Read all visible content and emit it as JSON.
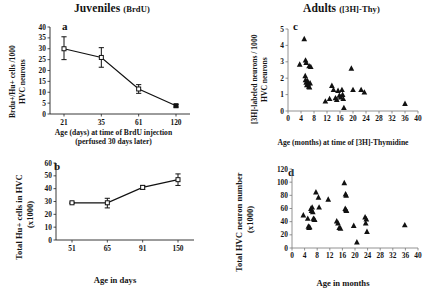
{
  "figure": {
    "group_titles": [
      {
        "main": "Juveniles",
        "sub": "(BrdU)"
      },
      {
        "main": "Adults",
        "sub": "([3H]-Thy)"
      }
    ]
  },
  "chart_data": [
    {
      "panel": "a",
      "type": "line",
      "title": "Juveniles (BrdU)",
      "xlabel": "Age (days) at time of BrdU injection",
      "xlabel_sub": "(perfused 30 days later)",
      "ylabel": "Brdu+/Hu+ cells /1000 HVC neurons",
      "categories": [
        "21",
        "35",
        "61",
        "120"
      ],
      "x": [
        21,
        35,
        61,
        120
      ],
      "values": [
        30.0,
        26.0,
        11.5,
        3.8
      ],
      "yerr_up": [
        5.5,
        4.5,
        2.0,
        0.6
      ],
      "yerr_down": [
        5.0,
        4.5,
        2.0,
        0.6
      ],
      "ylim": [
        0,
        40
      ],
      "yticks": [
        "0",
        "5",
        "10",
        "15",
        "20",
        "25",
        "30",
        "35",
        "40"
      ],
      "xticks": [
        "21",
        "35",
        "61",
        "120"
      ],
      "marker": "open-square",
      "grid": false,
      "legend": "none"
    },
    {
      "panel": "b",
      "type": "line",
      "title": "",
      "xlabel": "Age in days",
      "ylabel": "Total Hu+ cells in HVC (x1000)",
      "categories": [
        "51",
        "65",
        "91",
        "150"
      ],
      "x": [
        51,
        65,
        91,
        150
      ],
      "values": [
        29.0,
        29.0,
        41.0,
        47.0
      ],
      "yerr_up": [
        0.5,
        3.5,
        1.5,
        4.5
      ],
      "yerr_down": [
        0.5,
        4.0,
        1.5,
        4.5
      ],
      "ylim": [
        0,
        60
      ],
      "yticks": [
        "0",
        "10",
        "20",
        "30",
        "40",
        "50",
        "60"
      ],
      "xticks": [
        "51",
        "65",
        "91",
        "150"
      ],
      "marker": "open-square",
      "grid": false,
      "legend": "none"
    },
    {
      "panel": "c",
      "type": "scatter",
      "title": "Adults ([3H]-Thy)",
      "xlabel": "Age (months) at time of [3H]-Thymidine",
      "ylabel": "[3H]-labeled neurons / 1000 HVC neurons",
      "xlim": [
        0,
        40
      ],
      "ylim": [
        0,
        5
      ],
      "yticks": [
        "0",
        "1",
        "2",
        "3",
        "4",
        "5"
      ],
      "xticks": [
        "0",
        "4",
        "8",
        "12",
        "16",
        "20",
        "24",
        "28",
        "32",
        "36",
        "40"
      ],
      "marker": "filled-triangle",
      "grid": false,
      "legend": "none",
      "points": [
        [
          5.0,
          4.4
        ],
        [
          3.6,
          2.85
        ],
        [
          5.4,
          3.1
        ],
        [
          5.6,
          2.95
        ],
        [
          6.5,
          2.75
        ],
        [
          7.0,
          2.7
        ],
        [
          5.3,
          2.15
        ],
        [
          5.4,
          1.9
        ],
        [
          5.6,
          1.75
        ],
        [
          5.8,
          1.6
        ],
        [
          6.0,
          1.85
        ],
        [
          6.2,
          1.65
        ],
        [
          6.4,
          1.5
        ],
        [
          6.6,
          1.45
        ],
        [
          6.8,
          1.7
        ],
        [
          11.5,
          0.6
        ],
        [
          12.8,
          0.75
        ],
        [
          13.5,
          1.55
        ],
        [
          14.0,
          1.3
        ],
        [
          14.6,
          0.8
        ],
        [
          15.0,
          0.7
        ],
        [
          15.4,
          1.25
        ],
        [
          15.8,
          0.95
        ],
        [
          16.2,
          0.85
        ],
        [
          16.6,
          1.3
        ],
        [
          16.8,
          1.0
        ],
        [
          17.0,
          0.75
        ],
        [
          17.2,
          0.2
        ],
        [
          19.5,
          2.6
        ],
        [
          20.0,
          1.3
        ],
        [
          22.5,
          1.3
        ],
        [
          23.5,
          1.15
        ],
        [
          36.0,
          0.45
        ]
      ]
    },
    {
      "panel": "d",
      "type": "scatter",
      "title": "",
      "xlabel": "Age in months",
      "ylabel": "Total HVC neuron number (x1000)",
      "xlim": [
        0,
        40
      ],
      "ylim": [
        0,
        120
      ],
      "yticks": [
        "0",
        "20",
        "40",
        "60",
        "80",
        "100",
        "120"
      ],
      "xticks": [
        "0",
        "4",
        "8",
        "12",
        "16",
        "20",
        "24",
        "28",
        "32",
        "36",
        "40"
      ],
      "marker": "filled-triangle",
      "grid": false,
      "legend": "none",
      "points": [
        [
          3.6,
          50.0
        ],
        [
          5.0,
          45.0
        ],
        [
          5.2,
          33.0
        ],
        [
          5.4,
          31.0
        ],
        [
          5.6,
          32.0
        ],
        [
          6.0,
          60.0
        ],
        [
          6.2,
          57.0
        ],
        [
          6.4,
          62.0
        ],
        [
          6.6,
          55.0
        ],
        [
          6.8,
          45.0
        ],
        [
          7.0,
          44.0
        ],
        [
          7.2,
          43.0
        ],
        [
          7.6,
          85.0
        ],
        [
          8.4,
          77.0
        ],
        [
          8.6,
          62.0
        ],
        [
          11.5,
          74.0
        ],
        [
          14.2,
          41.0
        ],
        [
          14.6,
          38.0
        ],
        [
          15.0,
          31.0
        ],
        [
          15.4,
          30.0
        ],
        [
          16.6,
          99.0
        ],
        [
          17.0,
          82.0
        ],
        [
          17.2,
          80.0
        ],
        [
          16.9,
          60.0
        ],
        [
          17.1,
          58.0
        ],
        [
          17.3,
          57.0
        ],
        [
          19.6,
          34.0
        ],
        [
          20.6,
          9.0
        ],
        [
          23.2,
          47.0
        ],
        [
          23.6,
          44.0
        ],
        [
          23.4,
          38.0
        ],
        [
          23.8,
          25.0
        ],
        [
          35.8,
          35.0
        ]
      ]
    }
  ]
}
